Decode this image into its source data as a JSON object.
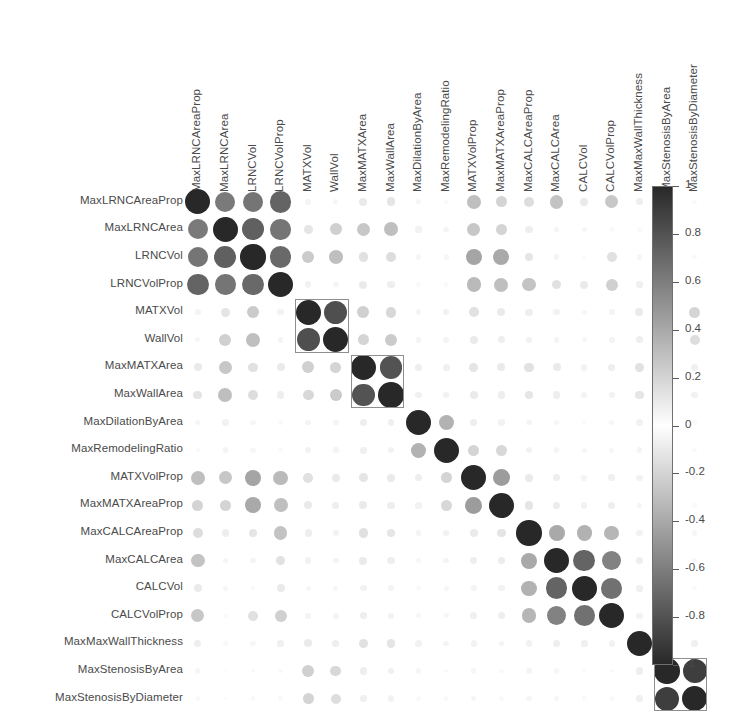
{
  "chart_data": {
    "type": "heatmap",
    "title": "",
    "subtitle": "",
    "xlabel": "",
    "ylabel": "",
    "grid": false,
    "legend_position": "right",
    "marker": "circle-area-scaled",
    "colormap": "grayscale-diverging",
    "colorbar": {
      "label": "",
      "ticks": [
        "1",
        "0.8",
        "0.6",
        "0.4",
        "0.2",
        "0",
        "-0.2",
        "-0.4",
        "-0.6",
        "-0.8",
        "-1"
      ],
      "tick_values": [
        1,
        0.8,
        0.6,
        0.4,
        0.2,
        0,
        -0.2,
        -0.4,
        -0.6,
        -0.8,
        -1
      ],
      "vmin": -1,
      "vmax": 1,
      "dark_at": "extremes",
      "light_at": "zero"
    },
    "categories": [
      "MaxLRNCAreaProp",
      "MaxLRNCArea",
      "LRNCVol",
      "LRNCVolProp",
      "MATXVol",
      "WallVol",
      "MaxMATXArea",
      "MaxWallArea",
      "MaxDilationByArea",
      "MaxRemodelingRatio",
      "MATXVolProp",
      "MaxMATXAreaProp",
      "MaxCALCAreaProp",
      "MaxCALCArea",
      "CALCVol",
      "CALCVolProp",
      "MaxMaxWallThickness",
      "MaxStenosisByArea",
      "MaxStenosisByDiameter"
    ],
    "row_labels": [
      "MaxLRNCAreaProp",
      "MaxLRNCArea",
      "LRNCVol",
      "LRNCVolProp",
      "MATXVol",
      "WallVol",
      "MaxMATXArea",
      "MaxWallArea",
      "MaxDilationByArea",
      "MaxRemodelingRatio",
      "MATXVolProp",
      "MaxMATXAreaProp",
      "MaxCALCAreaProp",
      "MaxCALCArea",
      "CALCVol",
      "CALCVolProp",
      "MaxMaxWallThickness",
      "MaxStenosisByArea",
      "MaxStenosisByDiameter"
    ],
    "column_labels": [
      "MaxLRNCAreaProp",
      "MaxLRNCArea",
      "LRNCVol",
      "LRNCVolProp",
      "MATXVol",
      "WallVol",
      "MaxMATXArea",
      "MaxWallArea",
      "MaxDilationByArea",
      "MaxRemodelingRatio",
      "MATXVolProp",
      "MaxMATXAreaProp",
      "MaxCALCAreaProp",
      "MaxCALCArea",
      "CALCVol",
      "CALCVolProp",
      "MaxMaxWallThickness",
      "MaxStenosisByArea",
      "MaxStenosisByDiameter"
    ],
    "matrix": [
      [
        1.0,
        0.62,
        0.64,
        0.72,
        0.05,
        0.04,
        0.1,
        0.12,
        0.04,
        0.03,
        0.3,
        0.2,
        0.16,
        0.28,
        0.1,
        0.26,
        0.08,
        0.04,
        0.03
      ],
      [
        0.62,
        1.0,
        0.74,
        0.64,
        0.12,
        0.22,
        0.26,
        0.3,
        0.06,
        0.05,
        0.26,
        0.2,
        0.08,
        0.05,
        0.04,
        0.03,
        0.03,
        0.02,
        0.02
      ],
      [
        0.64,
        0.74,
        1.0,
        0.7,
        0.24,
        0.3,
        0.14,
        0.16,
        0.04,
        0.04,
        0.42,
        0.4,
        0.12,
        0.05,
        0.03,
        0.14,
        0.04,
        0.03,
        0.03
      ],
      [
        0.72,
        0.64,
        0.7,
        1.0,
        0.06,
        0.05,
        0.1,
        0.08,
        0.03,
        0.03,
        0.32,
        0.3,
        0.28,
        0.14,
        0.1,
        0.22,
        0.07,
        0.03,
        0.03
      ],
      [
        0.05,
        0.12,
        0.24,
        0.06,
        1.0,
        0.82,
        0.22,
        0.18,
        0.05,
        0.06,
        0.14,
        0.1,
        0.08,
        0.06,
        0.04,
        0.05,
        0.1,
        0.22,
        0.2
      ],
      [
        0.04,
        0.22,
        0.3,
        0.05,
        0.82,
        1.0,
        0.2,
        0.24,
        0.05,
        0.05,
        0.1,
        0.08,
        0.06,
        0.05,
        0.04,
        0.05,
        0.08,
        0.18,
        0.16
      ],
      [
        0.1,
        0.26,
        0.14,
        0.1,
        0.22,
        0.2,
        1.0,
        0.8,
        0.08,
        0.07,
        0.12,
        0.1,
        0.14,
        0.1,
        0.06,
        0.08,
        0.14,
        0.08,
        0.07
      ],
      [
        0.12,
        0.3,
        0.16,
        0.08,
        0.18,
        0.24,
        0.8,
        1.0,
        0.07,
        0.06,
        0.1,
        0.08,
        0.12,
        0.08,
        0.05,
        0.06,
        0.12,
        0.07,
        0.06
      ],
      [
        0.04,
        0.06,
        0.04,
        0.03,
        0.05,
        0.05,
        0.08,
        0.07,
        1.0,
        0.36,
        0.08,
        0.06,
        0.05,
        0.04,
        0.03,
        0.04,
        0.06,
        0.04,
        0.03
      ],
      [
        0.03,
        0.05,
        0.04,
        0.03,
        0.06,
        0.05,
        0.07,
        0.06,
        0.36,
        1.0,
        0.2,
        0.18,
        0.06,
        0.05,
        0.04,
        0.04,
        0.05,
        0.03,
        0.03
      ],
      [
        0.3,
        0.26,
        0.42,
        0.32,
        0.14,
        0.1,
        0.12,
        0.1,
        0.08,
        0.2,
        1.0,
        0.46,
        0.1,
        0.08,
        0.05,
        0.07,
        0.06,
        0.04,
        0.04
      ],
      [
        0.2,
        0.2,
        0.4,
        0.3,
        0.1,
        0.08,
        0.1,
        0.08,
        0.06,
        0.18,
        0.46,
        1.0,
        0.12,
        0.09,
        0.06,
        0.08,
        0.05,
        0.03,
        0.03
      ],
      [
        0.16,
        0.08,
        0.12,
        0.28,
        0.08,
        0.06,
        0.14,
        0.12,
        0.05,
        0.06,
        0.1,
        0.12,
        1.0,
        0.4,
        0.36,
        0.34,
        0.06,
        0.05,
        0.04
      ],
      [
        0.28,
        0.05,
        0.05,
        0.14,
        0.06,
        0.05,
        0.1,
        0.08,
        0.04,
        0.05,
        0.08,
        0.09,
        0.4,
        1.0,
        0.72,
        0.58,
        0.08,
        0.04,
        0.04
      ],
      [
        0.1,
        0.04,
        0.03,
        0.1,
        0.04,
        0.04,
        0.06,
        0.05,
        0.03,
        0.04,
        0.05,
        0.06,
        0.36,
        0.72,
        1.0,
        0.66,
        0.07,
        0.03,
        0.03
      ],
      [
        0.26,
        0.03,
        0.14,
        0.22,
        0.05,
        0.05,
        0.08,
        0.06,
        0.04,
        0.04,
        0.07,
        0.08,
        0.34,
        0.58,
        0.66,
        1.0,
        0.06,
        0.03,
        0.03
      ],
      [
        0.08,
        0.03,
        0.04,
        0.07,
        0.1,
        0.08,
        0.14,
        0.12,
        0.06,
        0.05,
        0.06,
        0.05,
        0.06,
        0.08,
        0.07,
        0.06,
        1.0,
        0.08,
        0.07
      ],
      [
        0.04,
        0.02,
        0.03,
        0.03,
        0.22,
        0.18,
        0.08,
        0.07,
        0.04,
        0.03,
        0.04,
        0.03,
        0.05,
        0.04,
        0.03,
        0.03,
        0.08,
        1.0,
        0.9
      ],
      [
        0.03,
        0.02,
        0.03,
        0.03,
        0.2,
        0.16,
        0.07,
        0.06,
        0.03,
        0.03,
        0.04,
        0.03,
        0.04,
        0.04,
        0.03,
        0.03,
        0.07,
        0.9,
        1.0
      ]
    ],
    "cluster_boxes": [
      {
        "row_start": 4,
        "row_end": 5,
        "col_start": 4,
        "col_end": 5,
        "label": "matx-wall-vol-cluster"
      },
      {
        "row_start": 6,
        "row_end": 7,
        "col_start": 6,
        "col_end": 7,
        "label": "matx-wall-area-cluster"
      },
      {
        "row_start": 17,
        "row_end": 18,
        "col_start": 17,
        "col_end": 18,
        "label": "stenosis-cluster"
      }
    ]
  },
  "layout": {
    "matrix_left": 184,
    "matrix_top": 188,
    "cell_size": 27.6,
    "n": 19,
    "colorbar_left": 652,
    "colorbar_top": 186,
    "colorbar_width": 21,
    "colorbar_height": 479
  },
  "colors": {
    "background": "#ffffff",
    "text": "#4a4a4a",
    "cluster_box": "#8e8e8e",
    "colorbar_border": "#6f6f6f",
    "dark": "#2b2b2b",
    "light": "#ffffff"
  }
}
